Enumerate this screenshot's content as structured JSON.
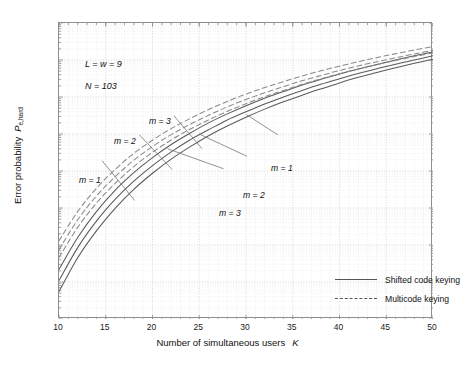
{
  "chart_data": {
    "type": "line",
    "title": "",
    "xlabel": "Number of simultaneous users",
    "xlabel_symbol": "K",
    "ylabel": "Error probability",
    "ylabel_symbol": "P",
    "ylabel_subscript": "e,hard",
    "xlim": [
      10,
      50
    ],
    "ylim": [
      1e-11,
      0.001
    ],
    "yscale": "log",
    "grid": true,
    "xticks": [
      10,
      15,
      20,
      25,
      30,
      35,
      40,
      45,
      50
    ],
    "ytick_labels": [
      "10-3",
      "10-4",
      "10-5",
      "10-6",
      "10-7",
      "10-8",
      "10-9",
      "10-10",
      "10-11"
    ],
    "ytick_exponents": [
      -3,
      -4,
      -5,
      -6,
      -7,
      -8,
      -9,
      -10,
      -11
    ],
    "legend_position": "lower right",
    "annotations": [
      {
        "text": "L = w = 9",
        "x": 12.4,
        "y": 0.00017
      },
      {
        "text": "N = 103",
        "x": 12.4,
        "y": 4.6e-05
      }
    ],
    "curve_labels": [
      {
        "text": "m = 1",
        "x": 13.0,
        "y": 2.9e-07,
        "points_to": "multicode m=1"
      },
      {
        "text": "m = 2",
        "x": 16.8,
        "y": 1.5e-06,
        "points_to": "multicode m=2"
      },
      {
        "text": "m = 3",
        "x": 20.4,
        "y": 4.6e-06,
        "points_to": "multicode m=3"
      },
      {
        "text": "m = 1",
        "x": 33.0,
        "y": 6.5e-07,
        "points_to": "shifted m=1"
      },
      {
        "text": "m = 2",
        "x": 30.0,
        "y": 1.7e-07,
        "points_to": "shifted m=2"
      },
      {
        "text": "m = 3",
        "x": 27.5,
        "y": 8e-08,
        "points_to": "shifted m=3"
      }
    ],
    "x": [
      10,
      12,
      14,
      16,
      18,
      20,
      22,
      24,
      26,
      28,
      30,
      32,
      34,
      36,
      38,
      40,
      42,
      44,
      46,
      48,
      50
    ],
    "series": [
      {
        "name": "Shifted code keying m = 1",
        "style": "solid",
        "color": "#5a5a5a",
        "values": [
          2.2e-10,
          1.6e-09,
          8e-09,
          3e-08,
          9e-08,
          2.3e-07,
          5.2e-07,
          1.05e-06,
          2e-06,
          3.5e-06,
          5.8e-06,
          9.2e-06,
          1.4e-05,
          2.1e-05,
          3e-05,
          4.2e-05,
          5.7e-05,
          7.6e-05,
          0.0001,
          0.00013,
          0.000165
        ]
      },
      {
        "name": "Shifted code keying m = 2",
        "style": "solid",
        "color": "#5a5a5a",
        "values": [
          1.1e-10,
          8.5e-10,
          4.4e-09,
          1.7e-08,
          5.3e-08,
          1.4e-07,
          3.3e-07,
          6.9e-07,
          1.3e-06,
          2.4e-06,
          4e-06,
          6.5e-06,
          1e-05,
          1.5e-05,
          2.2e-05,
          3.1e-05,
          4.3e-05,
          5.8e-05,
          7.7e-05,
          0.0001,
          0.00013
        ]
      },
      {
        "name": "Shifted code keying m = 3",
        "style": "solid",
        "color": "#5a5a5a",
        "values": [
          5.5e-11,
          4.5e-10,
          2.4e-09,
          9.8e-09,
          3.2e-08,
          8.7e-08,
          2.1e-07,
          4.5e-07,
          9e-07,
          1.65e-06,
          2.85e-06,
          4.7e-06,
          7.4e-06,
          1.12e-05,
          1.65e-05,
          2.4e-05,
          3.4e-05,
          4.6e-05,
          6.2e-05,
          8.2e-05,
          0.000105
        ]
      },
      {
        "name": "Multicode keying m = 1",
        "style": "dashed",
        "color": "#8a8a8a",
        "values": [
          1.3e-09,
          8e-09,
          3.4e-08,
          1.1e-07,
          3e-07,
          6.8e-07,
          1.4e-06,
          2.6e-06,
          4.6e-06,
          7.6e-06,
          1.2e-05,
          1.8e-05,
          2.6e-05,
          3.7e-05,
          5.1e-05,
          6.8e-05,
          9e-05,
          0.000116,
          0.000148,
          0.000186,
          0.00023
        ]
      },
      {
        "name": "Multicode keying m = 2",
        "style": "dashed",
        "color": "#8a8a8a",
        "values": [
          7.5e-10,
          4.8e-09,
          2.1e-08,
          7e-08,
          1.95e-07,
          4.6e-07,
          9.6e-07,
          1.82e-06,
          3.2e-06,
          5.4e-06,
          8.6e-06,
          1.3e-05,
          1.9e-05,
          2.75e-05,
          3.8e-05,
          5.2e-05,
          6.9e-05,
          9e-05,
          0.000115,
          0.000146,
          0.000182
        ]
      },
      {
        "name": "Multicode keying m = 3",
        "style": "dashed",
        "color": "#8a8a8a",
        "values": [
          4.6e-10,
          3e-09,
          1.35e-08,
          4.6e-08,
          1.32e-07,
          3.2e-07,
          6.9e-07,
          1.34e-06,
          2.4e-06,
          4.1e-06,
          6.6e-06,
          1.02e-05,
          1.5e-05,
          2.2e-05,
          3.1e-05,
          4.25e-05,
          5.7e-05,
          7.5e-05,
          9.7e-05,
          0.000124,
          0.000155
        ]
      }
    ]
  },
  "legend": {
    "items": [
      {
        "label": "Shifted code keying",
        "style": "solid"
      },
      {
        "label": "Multicode keying",
        "style": "dashed"
      }
    ]
  }
}
